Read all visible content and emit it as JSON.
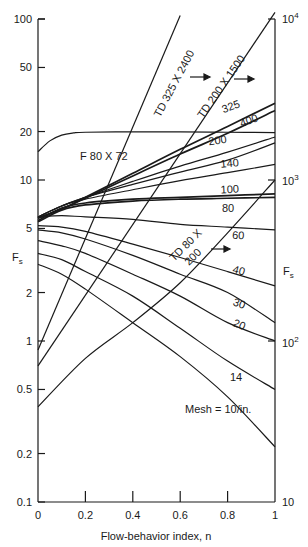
{
  "chart_data": {
    "type": "line",
    "title": "",
    "xlabel": "Flow-behavior index, n",
    "ylabel_left": "F_s",
    "ylabel_right": "F_s",
    "x_ticks": [
      "0",
      "0.2",
      "0.4",
      "0.6",
      "0.8",
      "1"
    ],
    "xlim": [
      0,
      1
    ],
    "y_left_scale": "log",
    "y_left_ticks": [
      "0.1",
      "0.2",
      "0.5",
      "1",
      "2",
      "5",
      "10",
      "20",
      "50",
      "100"
    ],
    "y_left_lim": [
      0.1,
      100
    ],
    "y_right_scale": "log",
    "y_right_ticks": [
      "10",
      "10^2",
      "10^3",
      "10^4"
    ],
    "y_right_lim": [
      10,
      10000
    ],
    "grid": false,
    "annotations": [
      "Mesh = 10/in.",
      "arrow → (TD 325 X 2400 uses right axis)",
      "arrow → (TD 200 X 1500 uses right axis)",
      "arrow → (TD 80 X 200 uses right axis)"
    ],
    "series": [
      {
        "name": "325",
        "axis": "left",
        "x": [
          0,
          0.1,
          0.2,
          0.4,
          0.6,
          0.8,
          1
        ],
        "values": [
          5.8,
          6.6,
          7.8,
          11.0,
          15.5,
          21.5,
          30.0
        ]
      },
      {
        "name": "400",
        "axis": "left",
        "x": [
          0,
          0.1,
          0.2,
          0.4,
          0.6,
          0.8,
          1
        ],
        "values": [
          5.8,
          6.6,
          7.7,
          10.6,
          14.5,
          19.5,
          27.0
        ]
      },
      {
        "name": "200",
        "axis": "left",
        "x": [
          0,
          0.1,
          0.2,
          0.4,
          0.6,
          0.8,
          1
        ],
        "values": [
          5.9,
          6.9,
          7.8,
          9.8,
          12.2,
          14.9,
          18.5
        ]
      },
      {
        "name": "140",
        "axis": "left",
        "x": [
          0,
          0.1,
          0.2,
          0.4,
          0.6,
          0.8,
          1
        ],
        "values": [
          5.9,
          6.9,
          7.8,
          9.4,
          11.2,
          13.3,
          17.0
        ]
      },
      {
        "name": "100",
        "axis": "left",
        "x": [
          0,
          0.1,
          0.2,
          0.4,
          0.6,
          0.8,
          1
        ],
        "values": [
          5.9,
          6.9,
          7.6,
          8.7,
          9.9,
          11.1,
          12.5
        ]
      },
      {
        "name": "80",
        "axis": "left",
        "x": [
          0,
          0.1,
          0.2,
          0.4,
          0.6,
          0.8,
          1
        ],
        "values": [
          5.6,
          6.7,
          7.2,
          7.6,
          7.8,
          8.0,
          8.2
        ]
      },
      {
        "name": "80b",
        "axis": "left",
        "x": [
          0,
          0.1,
          0.2,
          0.4,
          0.6,
          0.8,
          1
        ],
        "values": [
          5.5,
          6.5,
          7.0,
          7.4,
          7.6,
          7.7,
          7.8
        ]
      },
      {
        "name": "60",
        "axis": "left",
        "x": [
          0,
          0.1,
          0.2,
          0.4,
          0.6,
          0.8,
          1
        ],
        "values": [
          5.9,
          6.0,
          5.9,
          5.7,
          5.3,
          5.1,
          4.9
        ]
      },
      {
        "name": "40",
        "axis": "left",
        "x": [
          0,
          0.1,
          0.2,
          0.4,
          0.6,
          0.8,
          1
        ],
        "values": [
          5.2,
          5.1,
          4.8,
          4.0,
          3.3,
          2.7,
          2.2
        ]
      },
      {
        "name": "30",
        "axis": "left",
        "x": [
          0,
          0.1,
          0.2,
          0.4,
          0.6,
          0.8,
          1
        ],
        "values": [
          4.9,
          4.7,
          4.3,
          3.4,
          2.6,
          2.0,
          1.3
        ]
      },
      {
        "name": "20",
        "axis": "left",
        "x": [
          0,
          0.1,
          0.2,
          0.4,
          0.6,
          0.8,
          1
        ],
        "values": [
          4.2,
          3.9,
          3.5,
          2.6,
          1.9,
          1.3,
          1.0
        ]
      },
      {
        "name": "14",
        "axis": "left",
        "x": [
          0,
          0.1,
          0.2,
          0.4,
          0.6,
          0.8,
          1
        ],
        "values": [
          3.5,
          3.2,
          2.7,
          1.9,
          1.2,
          0.75,
          0.5
        ]
      },
      {
        "name": "10",
        "axis": "left",
        "x": [
          0,
          0.1,
          0.2,
          0.4,
          0.6,
          0.8,
          1
        ],
        "values": [
          3.0,
          2.6,
          2.1,
          1.3,
          0.8,
          0.45,
          0.22
        ]
      },
      {
        "name": "F 80 X 72",
        "axis": "left",
        "x": [
          0,
          0.05,
          0.1,
          0.15,
          0.2,
          0.4,
          0.6,
          0.8,
          1
        ],
        "values": [
          15.0,
          17.5,
          19.0,
          19.6,
          19.8,
          19.9,
          19.9,
          19.8,
          19.7
        ]
      },
      {
        "name": "TD 325 X 2400",
        "axis": "right",
        "x": [
          0,
          0.6
        ],
        "values": [
          88,
          10500
        ]
      },
      {
        "name": "TD 200 X 1500",
        "axis": "right",
        "x": [
          0,
          1
        ],
        "values": [
          70,
          11000
        ]
      },
      {
        "name": "TD 80 X 200",
        "axis": "right",
        "x": [
          0,
          0.2,
          0.4,
          0.6,
          0.8,
          1
        ],
        "values": [
          39,
          78,
          130,
          230,
          470,
          1000
        ]
      }
    ]
  },
  "labels": {
    "xlabel": "Flow-behavior index, n",
    "ylabel_left": "F",
    "ylabel_left_sub": "s",
    "ylabel_right": "F",
    "ylabel_right_sub": "s",
    "mesh_note": "Mesh = 10/in.",
    "f80": "F 80 X 72",
    "td325": "TD 325 X 2400",
    "td200": "TD 200 X 1500",
    "td80_line1": "TD 80 X",
    "td80_line2": "200",
    "right_ticks": {
      "t10": "10",
      "t100_base": "10",
      "t100_exp": "2",
      "t1000_base": "10",
      "t1000_exp": "3",
      "t10000_base": "10",
      "t10000_exp": "4"
    },
    "curve_labels": [
      "325",
      "400",
      "200",
      "140",
      "100",
      "80",
      "60",
      "40",
      "30",
      "20",
      "14"
    ]
  },
  "colors": {
    "line": "#1a1a1a",
    "background": "#ffffff"
  }
}
